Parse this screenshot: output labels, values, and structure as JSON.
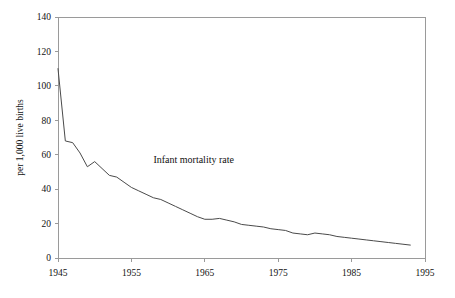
{
  "chart_data": {
    "type": "line",
    "title": "",
    "subtitle": "",
    "xlabel": "",
    "ylabel": "per 1,000 live births",
    "xlim": [
      1945,
      1995
    ],
    "ylim": [
      0,
      140
    ],
    "grid": false,
    "legend_position": "none",
    "annotations": [
      {
        "text": "Infant mortality rate",
        "x": 1958,
        "y": 55
      }
    ],
    "x_tick_labels": [
      "1945",
      "1955",
      "1965",
      "1975",
      "1985",
      "1995"
    ],
    "x_ticks": [
      1945,
      1955,
      1965,
      1975,
      1985,
      1995
    ],
    "y_tick_labels": [
      "0",
      "20",
      "40",
      "60",
      "80",
      "100",
      "120",
      "140"
    ],
    "y_ticks": [
      0,
      20,
      40,
      60,
      80,
      100,
      120,
      140
    ],
    "series": [
      {
        "name": "Infant mortality rate",
        "color": "#4a4a4a",
        "x": [
          1945,
          1946,
          1947,
          1948,
          1949,
          1950,
          1951,
          1952,
          1953,
          1954,
          1955,
          1956,
          1957,
          1958,
          1959,
          1960,
          1961,
          1962,
          1963,
          1964,
          1965,
          1966,
          1967,
          1968,
          1969,
          1970,
          1971,
          1972,
          1973,
          1974,
          1975,
          1976,
          1977,
          1978,
          1979,
          1980,
          1981,
          1982,
          1983,
          1984,
          1985,
          1986,
          1987,
          1988,
          1989,
          1990,
          1991,
          1992,
          1993
        ],
        "values": [
          110,
          68,
          67,
          61,
          53,
          56,
          52,
          48,
          47,
          44,
          41,
          39,
          37,
          35,
          34,
          32,
          30,
          28,
          26,
          24,
          22.5,
          22.5,
          23,
          22,
          21,
          19.5,
          19,
          18.5,
          18,
          17,
          16.5,
          16,
          14.5,
          14,
          13.5,
          14.5,
          14,
          13.5,
          12.5,
          12,
          11.5,
          11,
          10.5,
          10,
          9.5,
          9,
          8.5,
          8,
          7.5
        ]
      }
    ]
  },
  "plot_geometry": {
    "left": 58,
    "right": 425,
    "top": 17,
    "bottom": 258
  }
}
